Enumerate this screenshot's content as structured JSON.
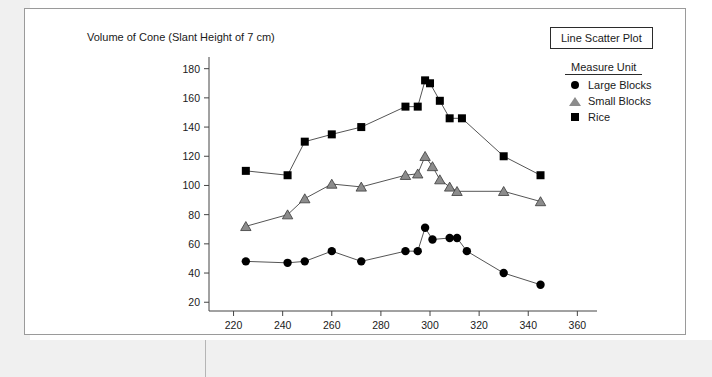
{
  "figure": {
    "title": "Volume of Cone (Slant Height of 7 cm)",
    "chart_type_badge": "Line Scatter Plot",
    "legend_title": "Measure Unit"
  },
  "legend": {
    "items": [
      {
        "label": "Large Blocks",
        "marker": "circle-icon",
        "color": "#000000"
      },
      {
        "label": "Small Blocks",
        "marker": "triangle-icon",
        "color": "#8c8c8c"
      },
      {
        "label": "Rice",
        "marker": "square-icon",
        "color": "#000000"
      }
    ]
  },
  "chart_data": {
    "type": "line",
    "title": "Volume of Cone (Slant Height of 7 cm)",
    "xlabel": "Angle Remaining (Degrees)",
    "ylabel": "",
    "xlim": [
      210,
      368
    ],
    "ylim": [
      14,
      188
    ],
    "xticks": [
      220,
      240,
      260,
      280,
      300,
      320,
      340,
      360
    ],
    "yticks": [
      20,
      40,
      60,
      80,
      100,
      120,
      140,
      160,
      180
    ],
    "grid": false,
    "legend_position": "top-right",
    "series": [
      {
        "name": "Large Blocks",
        "marker": "circle",
        "color": "#000000",
        "points": [
          [
            225,
            48
          ],
          [
            242,
            47
          ],
          [
            249,
            48
          ],
          [
            260,
            55
          ],
          [
            272,
            48
          ],
          [
            290,
            55
          ],
          [
            295,
            55
          ],
          [
            298,
            71
          ],
          [
            301,
            63
          ],
          [
            308,
            64
          ],
          [
            311,
            64
          ],
          [
            315,
            55
          ],
          [
            330,
            40
          ],
          [
            345,
            32
          ]
        ]
      },
      {
        "name": "Small Blocks",
        "marker": "triangle",
        "color": "#8c8c8c",
        "points": [
          [
            225,
            72
          ],
          [
            242,
            80
          ],
          [
            249,
            91
          ],
          [
            260,
            101
          ],
          [
            272,
            99
          ],
          [
            290,
            107
          ],
          [
            295,
            108
          ],
          [
            298,
            120
          ],
          [
            301,
            113
          ],
          [
            304,
            104
          ],
          [
            308,
            99
          ],
          [
            311,
            96
          ],
          [
            330,
            96
          ],
          [
            345,
            89
          ]
        ]
      },
      {
        "name": "Rice",
        "marker": "square",
        "color": "#000000",
        "points": [
          [
            225,
            110
          ],
          [
            242,
            107
          ],
          [
            249,
            130
          ],
          [
            260,
            135
          ],
          [
            272,
            140
          ],
          [
            290,
            154
          ],
          [
            295,
            154
          ],
          [
            298,
            172
          ],
          [
            300,
            170
          ],
          [
            304,
            158
          ],
          [
            308,
            146
          ],
          [
            313,
            146
          ],
          [
            330,
            120
          ],
          [
            345,
            107
          ]
        ]
      }
    ]
  }
}
